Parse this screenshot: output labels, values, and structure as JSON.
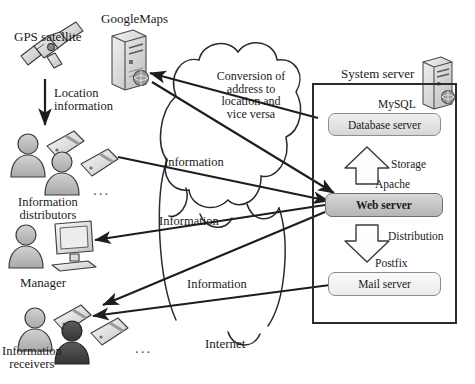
{
  "diagram": {
    "type": "system-architecture"
  },
  "actors": {
    "gps_satellite": "GPS satellite",
    "google_maps": "GoogleMaps",
    "information_distributors": "Information\ndistributors",
    "manager": "Manager",
    "information_receivers": "Information\nreceivers",
    "internet": "Internet",
    "system_server": "System server",
    "ellipsis": "..."
  },
  "server_components": [
    {
      "software": "MySQL",
      "role": "Database server"
    },
    {
      "software": "Apache",
      "role": "Web server"
    },
    {
      "software": "Postfix",
      "role": "Mail server"
    }
  ],
  "internal_flows": [
    {
      "label": "Storage",
      "direction": "up",
      "from": "Web server",
      "to": "Database server"
    },
    {
      "label": "Distribution",
      "direction": "down",
      "from": "Web server",
      "to": "Mail server"
    }
  ],
  "edge_labels": {
    "location_information": "Location\ninformation",
    "conversion": "Conversion of\naddress to\nlocation and\nvice versa",
    "information_1": "Information",
    "information_2": "Information",
    "information_3": "Information"
  },
  "colors": {
    "stroke": "#2b2b2b",
    "node_border": "#8d8d8d",
    "db_fill": "#e2e2e2",
    "web_fill": "#c4c4c4",
    "mail_fill": "#f2f2f2",
    "person_fill": "#bdbdbd",
    "person_dark_fill": "#4a4a4a",
    "background": "#ffffff"
  }
}
